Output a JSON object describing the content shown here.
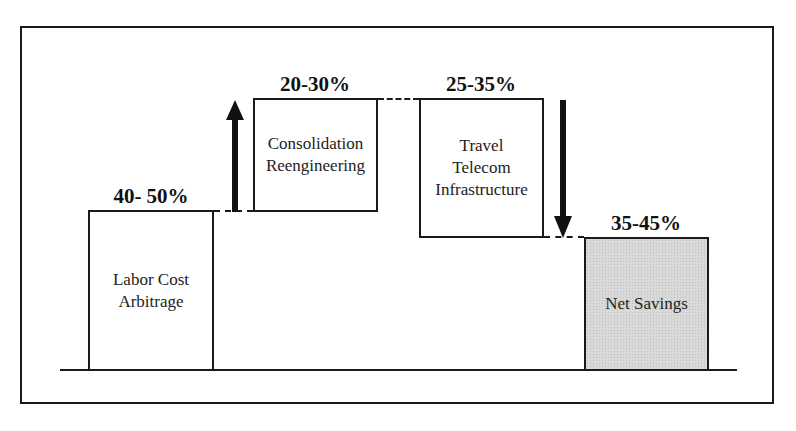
{
  "diagram": {
    "type": "waterfall",
    "steps": [
      {
        "label": "Labor Cost\nArbitrage",
        "value": "40- 50%",
        "kind": "base"
      },
      {
        "label": "Consolidation\nReengineering",
        "value": "20-30%",
        "kind": "increase"
      },
      {
        "label": "Travel\nTelecom\nInfrastructure",
        "value": "25-35%",
        "kind": "decrease"
      },
      {
        "label": "Net Savings",
        "value": "35-45%",
        "kind": "total"
      }
    ],
    "colors": {
      "line": "#1a1a1a",
      "total_fill": "#d9d9d9",
      "background": "#ffffff"
    }
  }
}
